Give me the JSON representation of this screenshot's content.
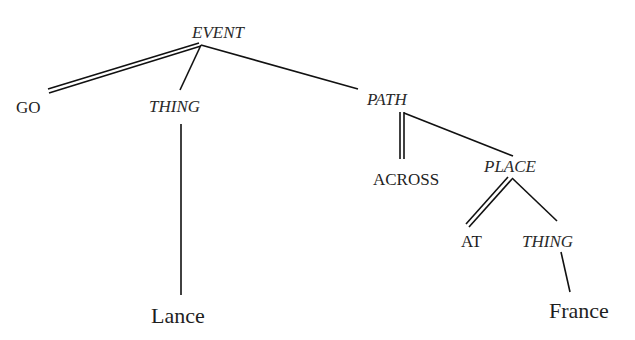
{
  "diagram": {
    "type": "conceptual-structure-tree",
    "nodes": [
      {
        "id": "event",
        "label": "EVENT",
        "kind": "category",
        "x": 192,
        "y": 38
      },
      {
        "id": "go",
        "label": "GO",
        "kind": "function",
        "x": 16,
        "y": 113
      },
      {
        "id": "thing1",
        "label": "THING",
        "kind": "category",
        "x": 149,
        "y": 112
      },
      {
        "id": "path",
        "label": "PATH",
        "kind": "category",
        "x": 367,
        "y": 105
      },
      {
        "id": "across",
        "label": "ACROSS",
        "kind": "function",
        "x": 373,
        "y": 185
      },
      {
        "id": "place",
        "label": "PLACE",
        "kind": "category",
        "x": 484,
        "y": 172
      },
      {
        "id": "at",
        "label": "AT",
        "kind": "function",
        "x": 461,
        "y": 247
      },
      {
        "id": "thing2",
        "label": "THING",
        "kind": "category",
        "x": 522,
        "y": 247
      },
      {
        "id": "lance",
        "label": "Lance",
        "kind": "leaf",
        "x": 151,
        "y": 323
      },
      {
        "id": "france",
        "label": "France",
        "kind": "leaf",
        "x": 549,
        "y": 318
      }
    ],
    "edges": [
      {
        "from": "event",
        "to": "go",
        "style": "double"
      },
      {
        "from": "event",
        "to": "thing1",
        "style": "single"
      },
      {
        "from": "event",
        "to": "path",
        "style": "single"
      },
      {
        "from": "thing1",
        "to": "lance",
        "style": "single"
      },
      {
        "from": "path",
        "to": "across",
        "style": "double"
      },
      {
        "from": "path",
        "to": "place",
        "style": "single"
      },
      {
        "from": "place",
        "to": "at",
        "style": "double"
      },
      {
        "from": "place",
        "to": "thing2",
        "style": "single"
      },
      {
        "from": "thing2",
        "to": "france",
        "style": "single"
      }
    ]
  }
}
